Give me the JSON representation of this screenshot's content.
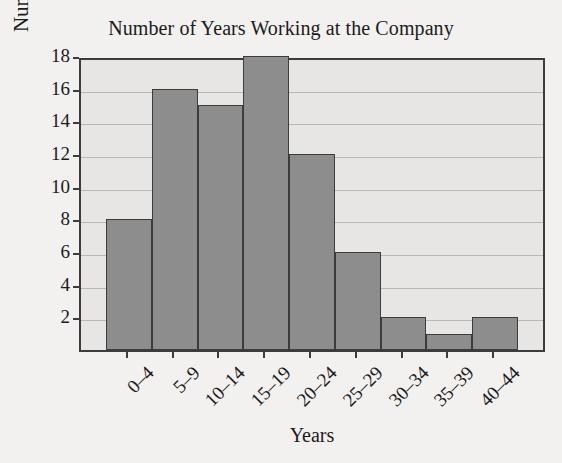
{
  "chart_data": {
    "type": "bar",
    "title": "Number of Years Working at the Company",
    "xlabel": "Years",
    "ylabel": "Number of Employees",
    "categories": [
      "0–4",
      "5–9",
      "10–14",
      "15–19",
      "20–24",
      "25–29",
      "30–34",
      "35–39",
      "40–44"
    ],
    "values": [
      8,
      16,
      15,
      18,
      12,
      6,
      2,
      1,
      2
    ],
    "ylim": [
      0,
      18
    ],
    "yticks": [
      2,
      4,
      6,
      8,
      10,
      12,
      14,
      16,
      18
    ],
    "ytick_labels": [
      "2",
      "4",
      "6",
      "8",
      "10",
      "12",
      "14",
      "16",
      "18"
    ],
    "grid": true,
    "grid_axis": "y",
    "legend": false,
    "bar_color": "#8d8d8d",
    "bar_edge_color": "#3c3c3c",
    "plot_background": "#e7e6e4",
    "figure_background": "#f3f1ef",
    "gridline_color": "#b9b8b6",
    "text_color": "#1b1b1b",
    "xtick_rotation": -45
  }
}
